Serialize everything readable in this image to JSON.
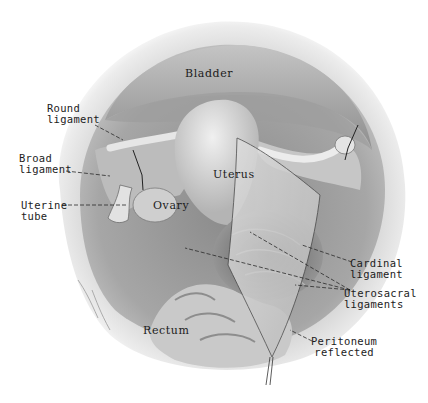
{
  "figure": {
    "style": "grayscale pencil anatomical illustration",
    "colors": {
      "background": "#ffffff",
      "label_text": "#1c1c1c",
      "leader_line": "#2a2a2a",
      "tissue_light": "#d8d8d8",
      "tissue_mid": "#a8a8a8",
      "tissue_dark": "#6e6e6e"
    }
  },
  "labels": {
    "bladder": "Bladder",
    "round_ligament": "Round\nligament",
    "broad_ligament": "Broad\nligament",
    "uterine_tube": "Uterine\ntube",
    "ovary": "Ovary",
    "uterus": "Uterus",
    "cardinal_ligament": "Cardinal\nligament",
    "uterosacral_ligaments": "Uterosacral\nligaments",
    "rectum": "Rectum",
    "peritoneum_reflected": "Peritoneum\nreflected"
  }
}
